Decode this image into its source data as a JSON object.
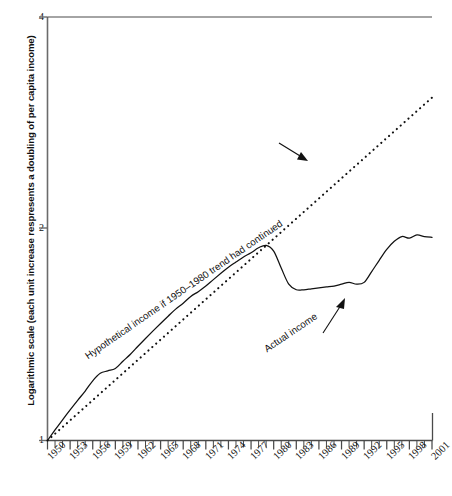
{
  "chart_data": {
    "type": "line",
    "title": "",
    "xlabel": "",
    "ylabel": "Logarithmic scale (each unit increase respresents a doubling of per capita income)",
    "xlim": [
      1950,
      2001
    ],
    "ylim": [
      1,
      4
    ],
    "y_ticks": [
      1,
      2,
      4
    ],
    "y_tick_labels": [
      "1",
      "2",
      "4"
    ],
    "x_tick_labels": [
      "1950",
      "1953",
      "1956",
      "1959",
      "1962",
      "1965",
      "1968",
      "1971",
      "1974",
      "1977",
      "1980",
      "1983",
      "1986",
      "1989",
      "1992",
      "1995",
      "1998",
      "2001"
    ],
    "x_tick_years": [
      1950,
      1953,
      1956,
      1959,
      1962,
      1965,
      1968,
      1971,
      1974,
      1977,
      1980,
      1983,
      1986,
      1989,
      1992,
      1995,
      1998,
      2001
    ],
    "x_minor_tick_interval": 1,
    "grid": false,
    "legend": "none",
    "annotations": [
      {
        "name": "hypothetical-trend-label",
        "text": "Hypothetical income if 1950–1980 trend had continued",
        "rotation_deg": -34.5,
        "arrow": "points up-right to dotted line"
      },
      {
        "name": "actual-income-label",
        "text": "Actual income",
        "rotation_deg": -34,
        "arrow": "points up-right to solid line"
      }
    ],
    "series": [
      {
        "name": "Hypothetical income if 1950-1980 trend had continued",
        "style": "dotted",
        "color": "#111111",
        "x": [
          1950,
          1953,
          1956,
          1959,
          1962,
          1965,
          1968,
          1971,
          1974,
          1977,
          1980,
          1983,
          1986,
          1989,
          1992,
          1995,
          1998,
          2001
        ],
        "values": [
          1.0,
          1.11,
          1.23,
          1.35,
          1.47,
          1.6,
          1.73,
          1.86,
          2.0,
          2.14,
          2.29,
          2.43,
          2.58,
          2.73,
          2.88,
          3.04,
          3.2,
          3.06
        ]
      },
      {
        "name": "Actual income",
        "style": "solid",
        "color": "#111111",
        "x": [
          1950,
          1951,
          1952,
          1953,
          1954,
          1955,
          1956,
          1957,
          1958,
          1959,
          1960,
          1961,
          1962,
          1963,
          1964,
          1965,
          1966,
          1967,
          1968,
          1969,
          1970,
          1971,
          1972,
          1973,
          1974,
          1975,
          1976,
          1977,
          1978,
          1979,
          1980,
          1981,
          1982,
          1983,
          1984,
          1985,
          1986,
          1987,
          1988,
          1989,
          1990,
          1991,
          1992,
          1993,
          1994,
          1995,
          1996,
          1997,
          1998,
          1999,
          2000,
          2001
        ],
        "values": [
          1.0,
          1.035,
          1.07,
          1.105,
          1.14,
          1.175,
          1.215,
          1.245,
          1.255,
          1.265,
          1.295,
          1.325,
          1.36,
          1.395,
          1.43,
          1.465,
          1.5,
          1.535,
          1.565,
          1.6,
          1.625,
          1.655,
          1.69,
          1.725,
          1.76,
          1.79,
          1.82,
          1.845,
          1.875,
          1.89,
          1.855,
          1.755,
          1.665,
          1.635,
          1.635,
          1.64,
          1.645,
          1.65,
          1.655,
          1.665,
          1.675,
          1.665,
          1.675,
          1.735,
          1.8,
          1.865,
          1.915,
          1.945,
          1.935,
          1.955,
          1.945,
          1.94
        ]
      }
    ]
  },
  "axis": {
    "y_label": "Logarithmic scale (each unit increase respresents a doubling of per capita income)",
    "y_tick_4": "4",
    "y_tick_2": "2",
    "y_tick_1": "1"
  },
  "annotations": {
    "hypothetical": "Hypothetical income if 1950–1980 trend had continued",
    "actual": "Actual income"
  }
}
